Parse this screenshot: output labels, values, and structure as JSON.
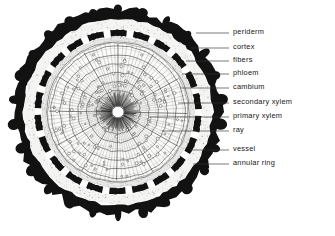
{
  "figure": {
    "background_color": "#ffffff",
    "ink_color": "#161616"
  },
  "diagram": {
    "center": {
      "x": 118,
      "y": 112
    },
    "pith": {
      "label": "pith",
      "radius": 6,
      "fill": "#ffffff"
    },
    "rings": [
      {
        "name": "periderm",
        "outer_radius": 104,
        "inner_radius": 94,
        "fill": "#121212",
        "style": "irregular-thick-black-band"
      },
      {
        "name": "cortex",
        "outer_radius": 94,
        "inner_radius": 84,
        "fill": "#f4f4f2",
        "style": "light-stippled-gap"
      },
      {
        "name": "fibers",
        "outer_radius": 84,
        "inner_radius": 76,
        "fill": "#121212",
        "style": "dashed-black-arcs"
      },
      {
        "name": "phloem",
        "outer_radius": 76,
        "inner_radius": 72,
        "fill": "#e8e8e6",
        "style": "thin-pale-band"
      },
      {
        "name": "cambium",
        "outer_radius": 72,
        "inner_radius": 70,
        "fill": "#8a8a8a",
        "style": "thin-dark-line"
      },
      {
        "name": "secondary xylem",
        "outer_radius": 70,
        "inner_radius": 16,
        "fill": "#fbfbfa",
        "style": "radial-ray-and-ring-grid"
      },
      {
        "name": "primary xylem",
        "outer_radius": 16,
        "inner_radius": 6,
        "fill": "#fdfdfd",
        "style": "dense-radial-wedges"
      }
    ],
    "annual_rings": {
      "count": 6,
      "radii": [
        22,
        31,
        40,
        49,
        58,
        67
      ]
    },
    "rays": {
      "count": 96,
      "description": "radial lines from pith to cambium"
    },
    "fiber_arc_count": 22,
    "vessel_dot_count": 150
  },
  "labels": [
    {
      "id": "periderm",
      "text": "periderm",
      "y": 33,
      "leader_from_x": 196,
      "leader_to_x": 229
    },
    {
      "id": "cortex",
      "text": "cortex",
      "y": 48,
      "leader_from_x": 191,
      "leader_to_x": 229
    },
    {
      "id": "fibers",
      "text": "fibers",
      "y": 61,
      "leader_from_x": 186,
      "leader_to_x": 229
    },
    {
      "id": "phloem",
      "text": "phloem",
      "y": 74,
      "leader_from_x": 182,
      "leader_to_x": 229
    },
    {
      "id": "cambium",
      "text": "cambium",
      "y": 88,
      "leader_from_x": 180,
      "leader_to_x": 229
    },
    {
      "id": "secondary-xylem",
      "text": "secondary xylem",
      "y": 103,
      "leader_from_x": 178,
      "leader_to_x": 229
    },
    {
      "id": "primary-xylem",
      "text": "primary xylem",
      "y": 117,
      "leader_from_x": 150,
      "leader_to_x": 229
    },
    {
      "id": "ray",
      "text": "ray",
      "y": 131,
      "leader_from_x": 162,
      "leader_to_x": 229
    },
    {
      "id": "vessel",
      "text": "vessel",
      "y": 150,
      "leader_from_x": 190,
      "leader_to_x": 229
    },
    {
      "id": "annular-ring",
      "text": "annular ring",
      "y": 164,
      "leader_from_x": 193,
      "leader_to_x": 229
    }
  ],
  "label_column": {
    "text_left_x": 233
  }
}
